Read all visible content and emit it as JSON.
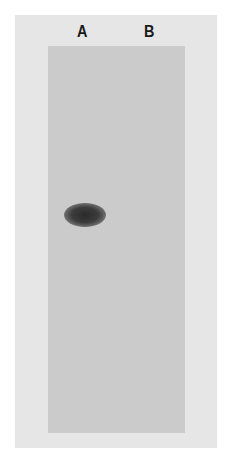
{
  "figure": {
    "lanes": [
      {
        "label": "A",
        "band": true
      },
      {
        "label": "B",
        "band": false
      }
    ]
  },
  "colors": {
    "background": "#ffffff",
    "outer_panel": "#e6e6e6",
    "gel": "#cbcbcb",
    "band": "#2a2a2a"
  }
}
